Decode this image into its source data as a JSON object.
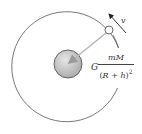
{
  "diagram": {
    "labels": {
      "velocity": "v",
      "force_coefficient": "G",
      "force_numerator": "mM",
      "force_denominator_open": "(",
      "force_denominator_R": "R",
      "force_denominator_plus": " + ",
      "force_denominator_h": "h",
      "force_denominator_close": ")",
      "force_denominator_exponent": "2"
    },
    "colors": {
      "orbit": "#555555",
      "planet_fill": "#c8c8c8",
      "planet_stroke": "#444444",
      "force_arrow": "#b8b8b8",
      "velocity_arrow": "#333333",
      "satellite_fill": "#ffffff"
    }
  }
}
